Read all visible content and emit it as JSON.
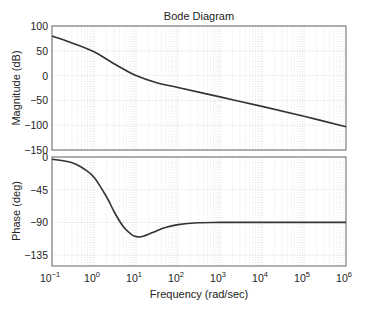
{
  "chart_data": [
    {
      "type": "line",
      "title": "Bode Diagram",
      "panel": "magnitude",
      "xlabel": "Frequency (rad/sec)",
      "ylabel": "Magnitude (dB)",
      "xscale": "log",
      "xlim": [
        0.1,
        1000000
      ],
      "ylim": [
        -150,
        100
      ],
      "yticks": [
        100,
        50,
        0,
        -50,
        -100,
        -150
      ],
      "grid": true,
      "series": [
        {
          "name": "Magnitude",
          "x": [
            0.1,
            0.3,
            1,
            3,
            10,
            30,
            100,
            1000,
            10000,
            100000,
            1000000
          ],
          "y": [
            80,
            66,
            48,
            24,
            0,
            -14,
            -24,
            -43,
            -62,
            -82,
            -103
          ]
        }
      ]
    },
    {
      "type": "line",
      "panel": "phase",
      "xlabel": "Frequency (rad/sec)",
      "ylabel": "Phase (deg)",
      "xscale": "log",
      "xlim": [
        0.1,
        1000000
      ],
      "ylim": [
        -150,
        0
      ],
      "yticks": [
        0,
        -45,
        -90,
        -135
      ],
      "xticks": [
        "10^-1",
        "10^0",
        "10^1",
        "10^2",
        "10^3",
        "10^4",
        "10^5",
        "10^6"
      ],
      "grid": true,
      "series": [
        {
          "name": "Phase",
          "x": [
            0.1,
            0.3,
            0.6,
            1,
            2,
            3,
            5,
            8,
            11,
            15,
            25,
            50,
            100,
            300,
            1000,
            10000,
            100000,
            1000000
          ],
          "y": [
            -3,
            -8,
            -17,
            -28,
            -55,
            -75,
            -96,
            -107,
            -110,
            -109,
            -104,
            -97,
            -93,
            -90.5,
            -90,
            -90,
            -90,
            -90
          ]
        }
      ]
    }
  ],
  "labels": {
    "title": "Bode Diagram",
    "mag_ylabel": "Magnitude (dB)",
    "phase_ylabel": "Phase (deg)",
    "xlabel": "Frequency (rad/sec)",
    "mag_yticks": [
      "100",
      "50",
      "0",
      "−50",
      "−100",
      "−150"
    ],
    "phase_yticks": [
      "0",
      "−45",
      "−90",
      "−135"
    ],
    "xtick_exps": [
      "−1",
      "0",
      "1",
      "2",
      "3",
      "4",
      "5",
      "6"
    ]
  },
  "colors": {
    "curve": "#333333",
    "axis": "#666666",
    "grid": "#bdbdbd"
  }
}
